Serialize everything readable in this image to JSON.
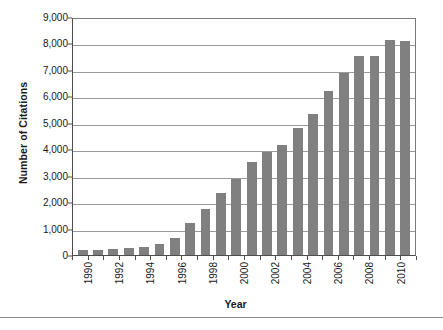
{
  "chart_data": {
    "type": "bar",
    "title": "",
    "xlabel": "Year",
    "ylabel": "Number of Citations",
    "categories": [
      "1990",
      "1991",
      "1992",
      "1993",
      "1994",
      "1995",
      "1996",
      "1997",
      "1998",
      "1999",
      "2000",
      "2001",
      "2002",
      "2003",
      "2004",
      "2005",
      "2006",
      "2007",
      "2008",
      "2009",
      "2010",
      "2011"
    ],
    "values": [
      180,
      190,
      230,
      250,
      290,
      420,
      640,
      1210,
      1740,
      2350,
      2860,
      3520,
      3900,
      4170,
      4800,
      5330,
      6200,
      6880,
      7510,
      7510,
      8120,
      8090
    ],
    "ylim": [
      0,
      9000
    ],
    "ytick_values": [
      0,
      1000,
      2000,
      3000,
      4000,
      5000,
      6000,
      7000,
      8000,
      9000
    ],
    "ytick_labels": [
      "0",
      "1,000",
      "2,000",
      "3,000",
      "4,000",
      "5,000",
      "6,000",
      "7,000",
      "8,000",
      "9,000"
    ],
    "xtick_labels_shown": [
      "1990",
      "1992",
      "1994",
      "1996",
      "1998",
      "2000",
      "2002",
      "2004",
      "2006",
      "2008",
      "2010"
    ],
    "grid": true,
    "grid_axis": "y",
    "legend": false,
    "legend_position": "none",
    "bar_color": "#808080",
    "grid_color": "#9a9a9a",
    "axis_color": "#4d4d4d",
    "background_color": "#ffffff"
  }
}
